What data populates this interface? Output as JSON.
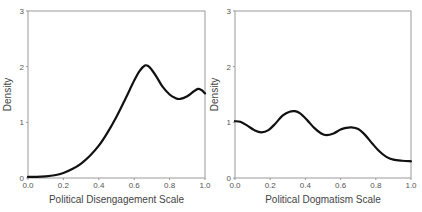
{
  "chart_data": [
    {
      "type": "line",
      "title": "",
      "xlabel": "Political Disengagement Scale",
      "ylabel": "Density",
      "xlim": [
        0,
        1
      ],
      "ylim": [
        0,
        3
      ],
      "xticks": [
        "0.0",
        "0.2",
        "0.4",
        "0.6",
        "0.8",
        "1.0"
      ],
      "yticks": [
        "0",
        "1",
        "2",
        "3"
      ],
      "grid": false,
      "legend": null,
      "series": [
        {
          "name": "density",
          "color": "#111111",
          "x": [
            0.0,
            0.05,
            0.1,
            0.15,
            0.2,
            0.25,
            0.3,
            0.35,
            0.4,
            0.45,
            0.5,
            0.55,
            0.6,
            0.63,
            0.66,
            0.68,
            0.7,
            0.73,
            0.76,
            0.8,
            0.83,
            0.86,
            0.9,
            0.93,
            0.96,
            0.98,
            1.0
          ],
          "y": [
            0.02,
            0.02,
            0.03,
            0.05,
            0.09,
            0.16,
            0.26,
            0.4,
            0.58,
            0.82,
            1.1,
            1.42,
            1.75,
            1.92,
            2.02,
            2.01,
            1.94,
            1.8,
            1.64,
            1.5,
            1.44,
            1.42,
            1.47,
            1.54,
            1.6,
            1.58,
            1.52
          ]
        }
      ]
    },
    {
      "type": "line",
      "title": "",
      "xlabel": "Political Dogmatism Scale",
      "ylabel": "Density",
      "xlim": [
        0,
        1
      ],
      "ylim": [
        0,
        3
      ],
      "xticks": [
        "0.0",
        "0.2",
        "0.4",
        "0.6",
        "0.8",
        "1.0"
      ],
      "yticks": [
        "0",
        "1",
        "2",
        "3"
      ],
      "grid": false,
      "legend": null,
      "series": [
        {
          "name": "density",
          "color": "#111111",
          "x": [
            0.0,
            0.03,
            0.07,
            0.11,
            0.15,
            0.19,
            0.23,
            0.27,
            0.31,
            0.34,
            0.37,
            0.41,
            0.45,
            0.49,
            0.52,
            0.56,
            0.6,
            0.63,
            0.66,
            0.7,
            0.74,
            0.78,
            0.82,
            0.86,
            0.9,
            0.95,
            1.0
          ],
          "y": [
            1.02,
            1.01,
            0.94,
            0.86,
            0.82,
            0.86,
            0.98,
            1.12,
            1.19,
            1.2,
            1.16,
            1.04,
            0.9,
            0.8,
            0.77,
            0.8,
            0.87,
            0.9,
            0.91,
            0.88,
            0.77,
            0.62,
            0.48,
            0.38,
            0.33,
            0.31,
            0.3
          ]
        }
      ]
    }
  ]
}
